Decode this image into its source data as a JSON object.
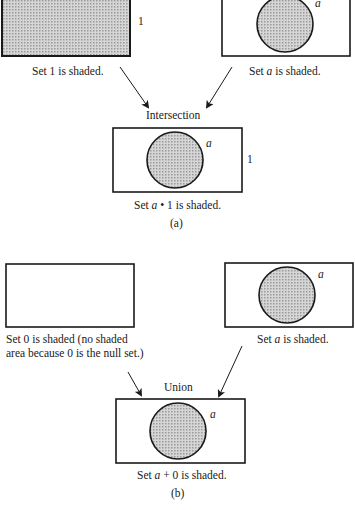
{
  "part_a": {
    "panel_1": {
      "set_label": "1",
      "caption": "Set 1 is shaded."
    },
    "panel_a": {
      "set_label": "a",
      "caption_pre": "Set ",
      "caption_var": "a",
      "caption_post": " is shaded."
    },
    "operation": "Intersection",
    "result": {
      "set_label_circle": "a",
      "set_label_rect": "1",
      "caption_pre": "Set ",
      "caption_var": "a",
      "caption_post": " • 1 is shaded."
    },
    "figure_label": "(a)"
  },
  "part_b": {
    "panel_0": {
      "caption_line1": "Set 0 is shaded (no shaded",
      "caption_line2": "area because 0 is the null set.)"
    },
    "panel_a": {
      "set_label": "a",
      "caption_pre": "Set ",
      "caption_var": "a",
      "caption_post": " is shaded."
    },
    "operation": "Union",
    "result": {
      "set_label_circle": "a",
      "caption_pre": "Set ",
      "caption_var": "a",
      "caption_post": " + 0 is shaded."
    },
    "figure_label": "(b)"
  },
  "colors": {
    "stroke": "#1a1a1a",
    "shade": "#c8c8c8"
  }
}
